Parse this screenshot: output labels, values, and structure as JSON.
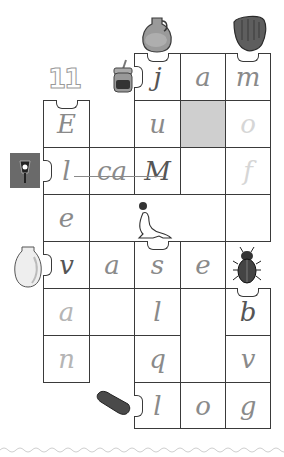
{
  "puzzle": {
    "number_label": "11",
    "colors": {
      "grid_line": "#3a3a3a",
      "blocked_cell": "#cfcfcf",
      "handwriting": "#8a8a8a"
    },
    "icons": [
      {
        "name": "jug-icon",
        "position": "above j cell"
      },
      {
        "name": "baseball-glove-icon",
        "position": "above m cell"
      },
      {
        "name": "jam-jar-icon",
        "position": "left of j cell"
      },
      {
        "name": "street-lamp-icon",
        "position": "left of row 3"
      },
      {
        "name": "vase-icon",
        "position": "left of v cell"
      },
      {
        "name": "seal-with-ball-icon",
        "position": "merged cell row 4"
      },
      {
        "name": "beetle-icon",
        "position": "above b cell"
      },
      {
        "name": "eraser-icon",
        "position": "left of l cell bottom"
      }
    ],
    "cells": {
      "r0c2": "j",
      "r0c3": "a",
      "r0c4": "m",
      "r1c0": "E",
      "r1c2": "u",
      "r1c4": "o",
      "r2c0": "l",
      "r2c1": "ca",
      "r2c2": "M",
      "r2c4": "f",
      "r3c0": "e",
      "r4c0": "v",
      "r4c1": "a",
      "r4c2": "s",
      "r4c3": "e",
      "r5c0": "a",
      "r5c2": "l",
      "r5c4": "b",
      "r6c0": "n",
      "r6c2": "q",
      "r6c4": "v",
      "r7c2": "l",
      "r7c3": "o",
      "r7c4": "g"
    }
  }
}
